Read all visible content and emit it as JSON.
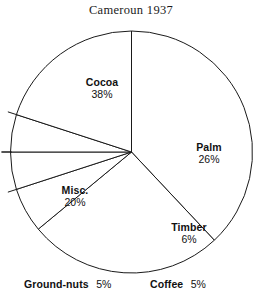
{
  "chart_data": {
    "type": "pie",
    "title": "Cameroun 1937",
    "subtitle": "",
    "xlabel": "",
    "ylabel": "",
    "legend": "none",
    "grid": false,
    "units": "percent",
    "start_angle_deg": 0,
    "direction": "clockwise",
    "categories": [
      "Cocoa",
      "Palm",
      "Timber",
      "Coffee",
      "Ground-nuts",
      "Misc."
    ],
    "values": [
      38,
      26,
      6,
      5,
      5,
      20
    ],
    "total": 100,
    "slices": [
      {
        "name": "Cocoa",
        "value": 38,
        "pct_label": "38%",
        "label_style": "stacked",
        "start_deg": 0,
        "end_deg": 136.8
      },
      {
        "name": "Palm",
        "value": 26,
        "pct_label": "26%",
        "label_style": "stacked",
        "start_deg": 136.8,
        "end_deg": 230.4
      },
      {
        "name": "Timber",
        "value": 6,
        "pct_label": "6%",
        "label_style": "stacked",
        "start_deg": 230.4,
        "end_deg": 252.0
      },
      {
        "name": "Coffee",
        "value": 5,
        "pct_label": "5%",
        "label_style": "inline",
        "start_deg": 252.0,
        "end_deg": 270.0
      },
      {
        "name": "Ground-nuts",
        "value": 5,
        "pct_label": "5%",
        "label_style": "inline",
        "start_deg": 270.0,
        "end_deg": 288.0
      },
      {
        "name": "Misc.",
        "value": 20,
        "pct_label": "20%",
        "label_style": "stacked",
        "start_deg": 288.0,
        "end_deg": 360.0
      }
    ],
    "colors": {
      "slice_fill": "#ffffff",
      "outline": "#1a1a1a",
      "background": "#ffffff",
      "text": "#111111",
      "title_text": "#1b1b1b"
    },
    "geometry": {
      "center_x": 131.5,
      "center_y": 152,
      "radius": 121,
      "leader_overshoot": 9
    }
  }
}
